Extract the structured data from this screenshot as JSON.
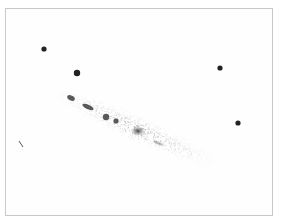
{
  "sketch": {
    "subject": "edge-on spiral galaxy sketch",
    "border_color": "#c9c9c9",
    "ink_color": "#222222",
    "stars": [
      {
        "x": 44,
        "y": 49,
        "r": 2.6
      },
      {
        "x": 77,
        "y": 73,
        "r": 3.2
      },
      {
        "x": 220,
        "y": 68,
        "r": 2.6
      },
      {
        "x": 238,
        "y": 123,
        "r": 2.6
      }
    ],
    "galaxy": {
      "center_x": 135,
      "center_y": 131,
      "angle_deg": 24
    }
  }
}
